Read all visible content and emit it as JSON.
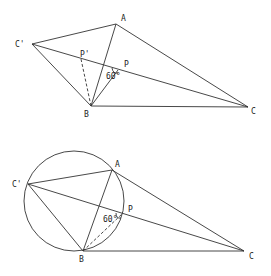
{
  "figures": [
    {
      "name": "top-figure",
      "points": {
        "A": {
          "x": 116,
          "y": 24,
          "label": "A",
          "lx": 121,
          "ly": 21
        },
        "B": {
          "x": 91,
          "y": 106,
          "label": "B",
          "lx": 84,
          "ly": 117
        },
        "C": {
          "x": 248,
          "y": 107,
          "label": "C",
          "lx": 251,
          "ly": 114
        },
        "Cp": {
          "x": 32,
          "y": 44,
          "label": "C'",
          "lx": 15,
          "ly": 47
        },
        "P": {
          "x": 118,
          "y": 70,
          "label": "P",
          "lx": 124,
          "ly": 67
        },
        "Pp": {
          "x": 81,
          "y": 59,
          "label": "P'",
          "lx": 80,
          "ly": 57
        }
      },
      "angle_label": {
        "text": "60°",
        "x": 106,
        "y": 79
      }
    },
    {
      "name": "bottom-figure",
      "circle": {
        "cx": 74,
        "cy": 201,
        "r": 50
      },
      "points": {
        "A": {
          "x": 112,
          "y": 170,
          "label": "A",
          "lx": 115,
          "ly": 167
        },
        "B": {
          "x": 83,
          "y": 251,
          "label": "B",
          "lx": 79,
          "ly": 262
        },
        "C": {
          "x": 244,
          "y": 251,
          "label": "C",
          "lx": 249,
          "ly": 259
        },
        "Cp": {
          "x": 28,
          "y": 184,
          "label": "C'",
          "lx": 12,
          "ly": 187
        },
        "P": {
          "x": 122,
          "y": 214,
          "label": "P",
          "lx": 128,
          "ly": 212
        }
      },
      "angle_label": {
        "text": "60°",
        "x": 103,
        "y": 222
      }
    }
  ]
}
